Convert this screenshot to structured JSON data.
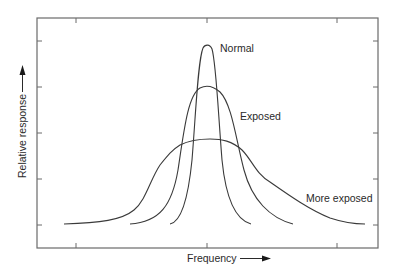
{
  "chart_data": {
    "type": "line",
    "title": "",
    "xlabel": "Frequency",
    "ylabel": "Relative response",
    "x_axis_arrow": true,
    "y_axis_arrow": true,
    "x_tick_labels": [],
    "y_tick_labels": [],
    "grid": false,
    "legend": "inline labels",
    "series": [
      {
        "name": "Normal",
        "label_pos": "right of peak",
        "relative_peak": 0.98,
        "relative_width": "narrow",
        "path": "M170,224 C181,222 188,200 192,160 C196,110 198,60 203,48 C205,44 210,44 212,49 C216,62 218,110 222,160 C226,200 236,220 251,224"
      },
      {
        "name": "Exposed",
        "label_pos": "right side",
        "relative_peak": 0.78,
        "relative_width": "medium",
        "path": "M130,224 C160,222 172,205 178,170 C184,130 188,95 200,88 C206,85 213,86 220,92 C232,104 236,140 244,170 C252,200 270,218 293,224"
      },
      {
        "name": "More exposed",
        "label_pos": "lower right",
        "relative_peak": 0.5,
        "relative_width": "broad",
        "path": "M64,224 C100,223 122,220 134,210 C146,200 150,180 160,165 C168,155 172,150 180,145 C190,140 198,139 210,139 C222,139 232,141 242,150 C252,160 256,174 270,182 C290,196 310,210 330,218 C345,223 355,224 365,224"
      }
    ],
    "y_ticks_px": [
      41,
      87,
      133,
      179,
      225
    ],
    "x_ticks_px": [
      76,
      207,
      337
    ]
  },
  "labels": {
    "normal": "Normal",
    "exposed": "Exposed",
    "more_exposed": "More exposed",
    "xlabel": "Frequency",
    "ylabel": "Relative response"
  }
}
